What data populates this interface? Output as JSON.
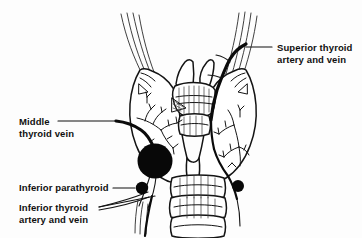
{
  "figure": {
    "background_color": "#fdfdfd",
    "ink_color": "#111111",
    "width": 362,
    "height": 238
  },
  "labels": [
    {
      "id": "superior-thyroid",
      "line1": "Superior thyroid",
      "line2": "artery and vein",
      "position": "top-right",
      "text_x": 277,
      "text_y1": 51,
      "text_y2": 63,
      "leader": "M 272 47 L 246 47",
      "anchor": "start"
    },
    {
      "id": "middle-thyroid-vein",
      "line1": "Middle",
      "line2": "thyroid vein",
      "position": "left-middle",
      "text_x": 19,
      "text_y1": 125,
      "text_y2": 137,
      "leader": "M 58 121 L 116 121",
      "anchor": "start"
    },
    {
      "id": "inferior-parathyroid",
      "line1": "Inferior parathyroid",
      "line2": "",
      "position": "left-lower",
      "text_x": 19,
      "text_y1": 191,
      "text_y2": 0,
      "leader": "M 113 188 L 135 188",
      "anchor": "start"
    },
    {
      "id": "inferior-thyroid",
      "line1": "Inferior thyroid",
      "line2": "artery and vein",
      "position": "left-bottom",
      "text_x": 19,
      "text_y1": 211,
      "text_y2": 223,
      "leader": "M 99 207 L 155 196",
      "anchor": "start"
    }
  ],
  "structures": [
    {
      "id": "right-thyroid-lobe",
      "name": "Right lobe of thyroid gland"
    },
    {
      "id": "left-thyroid-lobe",
      "name": "Left lobe of thyroid gland"
    },
    {
      "id": "isthmus",
      "name": "Isthmus of thyroid gland"
    },
    {
      "id": "thyroid-cartilage",
      "name": "Thyroid cartilage / larynx"
    },
    {
      "id": "cricoid-cartilage",
      "name": "Cricoid cartilage"
    },
    {
      "id": "trachea",
      "name": "Trachea with cartilage rings"
    },
    {
      "id": "superior-vessel-bundle-right",
      "name": "Superior thyroid artery and vein (right)"
    },
    {
      "id": "superior-vessel-bundle-left",
      "name": "Superior thyroid artery and vein (left)"
    },
    {
      "id": "middle-thyroid-vein-vessel",
      "name": "Middle thyroid vein"
    },
    {
      "id": "inferior-thyroid-vessel",
      "name": "Inferior thyroid artery and vein"
    },
    {
      "id": "parathyroid-gland-large",
      "name": "Inferior parathyroid gland (enlarged)"
    },
    {
      "id": "parathyroid-gland-small-left",
      "name": "Inferior parathyroid gland (left)"
    },
    {
      "id": "parathyroid-gland-small-right",
      "name": "Inferior parathyroid gland (right)"
    }
  ],
  "markers": {
    "large_nodule": {
      "cx": 155,
      "cy": 161,
      "r": 17.5,
      "color": "#080808"
    },
    "dot_left": {
      "cx": 142,
      "cy": 188,
      "r": 6.2,
      "color": "#080808"
    },
    "dot_right": {
      "cx": 238,
      "cy": 186,
      "r": 6.0,
      "color": "#080808"
    }
  }
}
